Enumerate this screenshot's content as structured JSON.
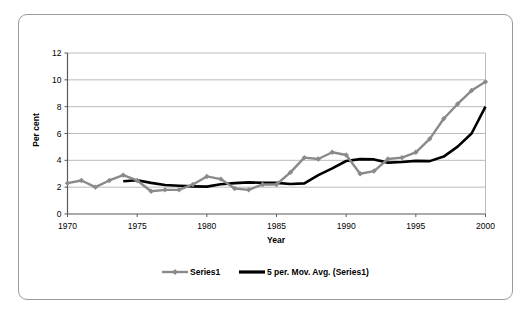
{
  "frame": {
    "name": "chart-card"
  },
  "chart_data": {
    "type": "line",
    "title": "",
    "xlabel": "Year",
    "ylabel": "Per cent",
    "xlim": [
      1970,
      2000
    ],
    "ylim": [
      0,
      12
    ],
    "yticks": [
      0,
      2,
      4,
      6,
      8,
      10,
      12
    ],
    "xticks": [
      1970,
      1975,
      1980,
      1985,
      1990,
      1995,
      2000
    ],
    "grid": "horizontal",
    "legend_position": "bottom",
    "colors": {
      "series1": "#8a8a8a",
      "moving_average": "#000000",
      "grid": "#b3b3b3",
      "axis": "#595959"
    },
    "x": [
      1970,
      1971,
      1972,
      1973,
      1974,
      1975,
      1976,
      1977,
      1978,
      1979,
      1980,
      1981,
      1982,
      1983,
      1984,
      1985,
      1986,
      1987,
      1988,
      1989,
      1990,
      1991,
      1992,
      1993,
      1994,
      1995,
      1996,
      1997,
      1998,
      1999,
      2000
    ],
    "series": [
      {
        "name": "Series1",
        "marker": "diamond",
        "color": "#8a8a8a",
        "values": [
          2.3,
          2.5,
          2.0,
          2.5,
          2.9,
          2.5,
          1.7,
          1.8,
          1.8,
          2.2,
          2.8,
          2.6,
          1.9,
          1.8,
          2.2,
          2.2,
          3.1,
          4.2,
          4.1,
          4.6,
          4.4,
          3.0,
          3.2,
          4.1,
          4.2,
          4.6,
          5.6,
          7.1,
          8.2,
          9.2,
          9.85
        ]
      },
      {
        "name": "5 per. Mov. Avg. (Series1)",
        "marker": "none",
        "color": "#000000",
        "x": [
          1974,
          1975,
          1976,
          1977,
          1978,
          1979,
          1980,
          1981,
          1982,
          1983,
          1984,
          1985,
          1986,
          1987,
          1988,
          1989,
          1990,
          1991,
          1992,
          1993,
          1994,
          1995,
          1996,
          1997,
          1998,
          1999,
          2000
        ],
        "values": [
          2.44,
          2.52,
          2.32,
          2.16,
          2.1,
          2.06,
          2.04,
          2.22,
          2.3,
          2.36,
          2.32,
          2.32,
          2.24,
          2.28,
          2.9,
          3.4,
          3.95,
          4.09,
          4.07,
          3.83,
          3.88,
          3.96,
          3.94,
          4.28,
          5.02,
          6.0,
          8.0
        ]
      }
    ],
    "legend": [
      {
        "label": "Series1",
        "style": "line-marker",
        "color": "#8a8a8a"
      },
      {
        "label": "5 per. Mov. Avg. (Series1)",
        "style": "line-thick",
        "color": "#000000"
      }
    ]
  }
}
